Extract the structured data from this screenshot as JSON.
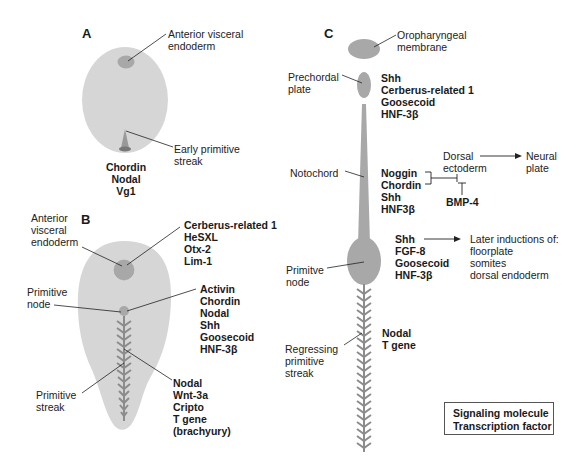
{
  "panels": {
    "A": {
      "label": "A",
      "callouts": {
        "ave": "Anterior visceral\nendoderm",
        "streak": "Early primitive\nstreak"
      },
      "genes": "Chordin\nNodal\nVg1"
    },
    "B": {
      "label": "B",
      "callouts": {
        "ave": "Anterior\nvisceral\nendoderm",
        "node": "Primitive\nnode",
        "streak": "Primitive\nstreak"
      },
      "genes_ave": "Cerberus-related 1\nHeSXL\nOtx-2\nLim-1",
      "genes_node": "Activin\nChordin\nNodal\nShh\nGoosecoid\nHNF-3β",
      "genes_streak": "Nodal\nWnt-3a\nCripto\nT gene\n(brachyury)"
    },
    "C": {
      "label": "C",
      "callouts": {
        "oropharyngeal": "Oropharyngeal\nmembrane",
        "prechordal": "Prechordal\nplate",
        "notochord": "Notochord",
        "node": "Primitve\nnode",
        "regressing": "Regressing\nprimitive\nstreak"
      },
      "genes_prechordal": "Shh\nCerberus-related 1\nGoosecoid\nHNF-3β",
      "genes_notochord": {
        "noggin": "Noggin",
        "chordin": "Chordin",
        "rest": "Shh\nHNF3β"
      },
      "dorsal_ectoderm": "Dorsal\nectoderm",
      "neural_plate": "Neural\nplate",
      "bmp4": "BMP-4",
      "genes_node": "Shh\nFGF-8\nGoosecoid\nHNF-3β",
      "later_inductions": "Later inductions of:\nfloorplate\nsomites\ndorsal endoderm",
      "genes_streak": "Nodal\nT gene"
    }
  },
  "legend": {
    "items": [
      "Signaling molecule",
      "Transcription factor"
    ]
  },
  "colors": {
    "embryo_fill": "#d6d6d6",
    "structure_fill": "#a8a8a8",
    "streak": "#8c8c8c",
    "line": "#222222"
  }
}
